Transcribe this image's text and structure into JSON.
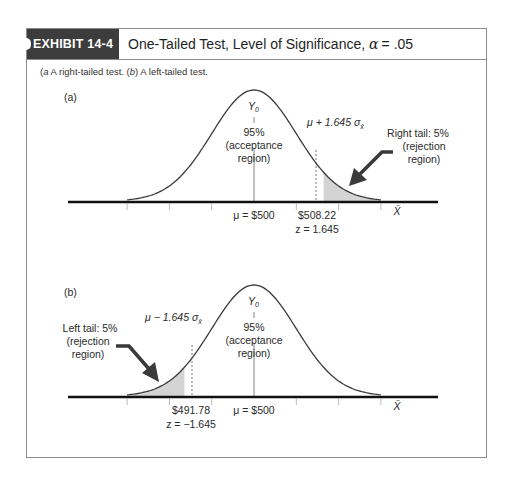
{
  "exhibit": {
    "badge": "EXHIBIT 14-4",
    "title_text": "One-Tailed Test, Level of Significance,",
    "alpha_symbol": "α",
    "alpha_value": "= .05",
    "caption_a_marker": "a",
    "caption_a_text": " A right-tailed test. (",
    "caption_b_marker": "b",
    "caption_b_text": ") A left-tailed test."
  },
  "chart_data": [
    {
      "type": "area",
      "panel_label": "(a)",
      "title": "A right-tailed test",
      "distribution": "normal",
      "mean": 500,
      "critical_value": 508.22,
      "z": 1.645,
      "tail": "right",
      "alpha": 0.05,
      "labels": {
        "peak": "Y",
        "peak_sub": "0",
        "acceptance_pct": "95%",
        "acceptance_line1": "(acceptance",
        "acceptance_line2": "region)",
        "critical_formula": "μ + 1.645 σ",
        "critical_sub": "x̄",
        "tail_line1": "Right tail: 5%",
        "tail_line2": "(rejection",
        "tail_line3": "region)",
        "mean_label": "μ = $500",
        "crit_value_label": "$508.22",
        "z_label": "z = 1.645",
        "xlabel": "X̄"
      }
    },
    {
      "type": "area",
      "panel_label": "(b)",
      "title": "A left-tailed test",
      "distribution": "normal",
      "mean": 500,
      "critical_value": 491.78,
      "z": -1.645,
      "tail": "left",
      "alpha": 0.05,
      "labels": {
        "peak": "Y",
        "peak_sub": "0",
        "acceptance_pct": "95%",
        "acceptance_line1": "(acceptance",
        "acceptance_line2": "region)",
        "critical_formula": "μ − 1.645 σ",
        "critical_sub": "x̄",
        "tail_line1": "Left tail: 5%",
        "tail_line2": "(rejection",
        "tail_line3": "region)",
        "mean_label": "μ = $500",
        "crit_value_label": "$491.78",
        "z_label": "z = −1.645",
        "xlabel": "X̄"
      }
    }
  ],
  "colors": {
    "badge_bg": "#3c3c3c",
    "shade": "#d4d4d4",
    "curve": "#3a3a3a",
    "axis": "#111111",
    "arrow": "#3a3a3a"
  }
}
